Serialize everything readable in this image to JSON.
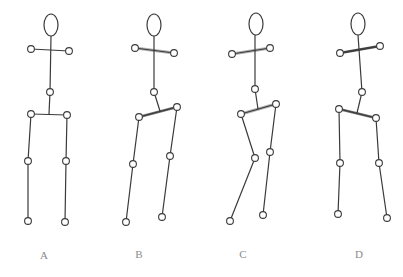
{
  "figures": [
    {
      "label": "A",
      "label_pos": [
        44,
        259
      ],
      "head": {
        "cx": 51,
        "cy": 25,
        "rx": 7,
        "ry": 11
      },
      "neck": [
        51,
        36
      ],
      "shoulder_center": [
        50,
        50
      ],
      "shoulder_l": [
        31,
        49
      ],
      "shoulder_r": [
        69,
        51
      ],
      "spine_mid": [
        50,
        92
      ],
      "hip_center": [
        49,
        114
      ],
      "hip_l": [
        31,
        114
      ],
      "hip_r": [
        67,
        115
      ],
      "knee_l": [
        28,
        161
      ],
      "knee_r": [
        66,
        161
      ],
      "foot_l": [
        28,
        221
      ],
      "foot_r": [
        65,
        222
      ],
      "shoulder_style": "none",
      "hip_style": "none"
    },
    {
      "label": "B",
      "label_pos": [
        139,
        258
      ],
      "head": {
        "cx": 154,
        "cy": 25,
        "rx": 7,
        "ry": 11
      },
      "neck": [
        154,
        36
      ],
      "shoulder_center": [
        154,
        50
      ],
      "shoulder_l": [
        135,
        48
      ],
      "shoulder_r": [
        174,
        53
      ],
      "spine_mid": [
        154,
        92
      ],
      "hip_center": [
        160,
        111
      ],
      "hip_l": [
        139,
        117
      ],
      "hip_r": [
        177,
        107
      ],
      "knee_l": [
        133,
        164
      ],
      "knee_r": [
        170,
        156
      ],
      "foot_l": [
        126,
        222
      ],
      "foot_r": [
        162,
        217
      ],
      "shoulder_style": "light",
      "hip_style": "mid"
    },
    {
      "label": "C",
      "label_pos": [
        243,
        258
      ],
      "head": {
        "cx": 256,
        "cy": 24,
        "rx": 7,
        "ry": 11
      },
      "neck": [
        255,
        35
      ],
      "shoulder_center": [
        252,
        51
      ],
      "shoulder_l": [
        232,
        54
      ],
      "shoulder_r": [
        270,
        48
      ],
      "spine_mid": [
        255,
        89
      ],
      "hip_center": [
        258,
        109
      ],
      "hip_l": [
        241,
        114
      ],
      "hip_r": [
        276,
        104
      ],
      "knee_l": [
        255,
        158
      ],
      "knee_r": [
        270,
        152
      ],
      "foot_l": [
        230,
        221
      ],
      "foot_r": [
        263,
        215
      ],
      "shoulder_style": "light",
      "hip_style": "light"
    },
    {
      "label": "D",
      "label_pos": [
        359,
        258
      ],
      "head": {
        "cx": 358,
        "cy": 24,
        "rx": 7,
        "ry": 11
      },
      "neck": [
        358,
        35
      ],
      "shoulder_center": [
        360,
        50
      ],
      "shoulder_l": [
        340,
        53
      ],
      "shoulder_r": [
        380,
        46
      ],
      "spine_mid": [
        362,
        92
      ],
      "hip_center": [
        357,
        113
      ],
      "hip_l": [
        339,
        109
      ],
      "hip_r": [
        376,
        118
      ],
      "knee_l": [
        340,
        163
      ],
      "knee_r": [
        379,
        163
      ],
      "foot_l": [
        338,
        214
      ],
      "foot_r": [
        387,
        218
      ],
      "shoulder_style": "dark",
      "hip_style": "mid"
    }
  ],
  "colors": {
    "line": "#3a3a3a",
    "highlight_light": "#a8a8a8",
    "highlight_dark": "#4a4a4a",
    "label": "#8a8a8a",
    "background": "#ffffff"
  }
}
